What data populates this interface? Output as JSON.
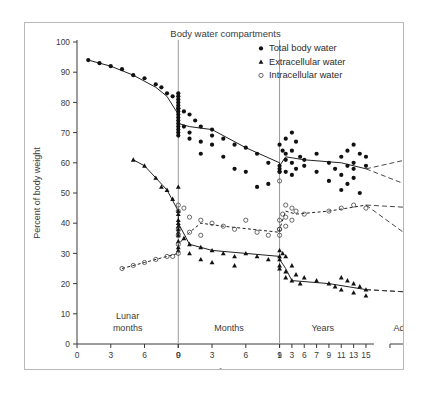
{
  "figure": {
    "title": "Body water compartments",
    "xlabel": "Age",
    "ylabel": "Percent of body weight"
  },
  "legend": {
    "items": [
      {
        "label": "Total body water",
        "marker": "filled-circle"
      },
      {
        "label": "Extracellular water",
        "marker": "filled-triangle"
      },
      {
        "label": "Intracellular water",
        "marker": "open-circle"
      }
    ]
  },
  "axes": {
    "y_ticks": [
      0,
      10,
      20,
      30,
      40,
      50,
      60,
      70,
      80,
      90,
      100
    ],
    "ylim": [
      0,
      100
    ],
    "segments": [
      {
        "name": "Lunar months",
        "ticks": [
          "0",
          "3",
          "6",
          "9"
        ]
      },
      {
        "name": "Months",
        "ticks": [
          "0",
          "3",
          "6",
          "9"
        ]
      },
      {
        "name": "Years",
        "ticks": [
          "1",
          "3",
          "6",
          "7",
          "9",
          "11",
          "13",
          "15"
        ]
      },
      {
        "name": "Adults",
        "ticks": []
      }
    ],
    "sex_symbols": {
      "male": "♂",
      "female": "♀"
    }
  },
  "chart_data": {
    "type": "scatter",
    "title": "Body water compartments",
    "xlabel": "Age",
    "ylabel": "Percent of body weight",
    "ylim": [
      0,
      100
    ],
    "grid": false,
    "legend_position": "top-right",
    "x_axis_note": "Ordinal composite axis: lunar months 0-9 (fetal), postnatal months 0-9, years 1-15, then a separate Adults block",
    "dividers": [
      {
        "label": "birth",
        "at": "lunar 9 / month 0"
      },
      {
        "label": "one year",
        "at": "months 9 / year 1"
      }
    ],
    "series": [
      {
        "name": "Total body water",
        "marker": "filled-circle",
        "line": "solid",
        "trend": [
          {
            "x": "lunar 1",
            "y": 94
          },
          {
            "x": "lunar 3",
            "y": 92
          },
          {
            "x": "lunar 5",
            "y": 89
          },
          {
            "x": "lunar 7",
            "y": 85
          },
          {
            "x": "lunar 8",
            "y": 82
          },
          {
            "x": "lunar 9",
            "y": 76
          },
          {
            "x": "birth",
            "y": 73
          },
          {
            "x": "month 1",
            "y": 72
          },
          {
            "x": "month 3",
            "y": 71
          },
          {
            "x": "month 6",
            "y": 65
          },
          {
            "x": "month 9",
            "y": 60
          },
          {
            "x": "year 1",
            "y": 59
          },
          {
            "x": "year 2",
            "y": 62
          },
          {
            "x": "year 6",
            "y": 61
          },
          {
            "x": "year 11",
            "y": 60
          },
          {
            "x": "year 15",
            "y": 58
          }
        ],
        "adult_branches": [
          {
            "sex": "male",
            "value": 62
          },
          {
            "sex": "female",
            "value": 51
          }
        ],
        "points": [
          {
            "x": "lunar 1",
            "y": 94
          },
          {
            "x": "lunar 2",
            "y": 93
          },
          {
            "x": "lunar 3",
            "y": 92
          },
          {
            "x": "lunar 4",
            "y": 91
          },
          {
            "x": "lunar 5",
            "y": 89
          },
          {
            "x": "lunar 6",
            "y": 88
          },
          {
            "x": "lunar 7",
            "y": 86
          },
          {
            "x": "lunar 7.5",
            "y": 85
          },
          {
            "x": "lunar 8",
            "y": 83
          },
          {
            "x": "lunar 8.5",
            "y": 82
          },
          {
            "x": "lunar 9",
            "y": 81
          },
          {
            "x": "lunar 9",
            "y": 78
          },
          {
            "x": "birth",
            "y": 83
          },
          {
            "x": "birth",
            "y": 82
          },
          {
            "x": "birth",
            "y": 80
          },
          {
            "x": "birth",
            "y": 79
          },
          {
            "x": "birth",
            "y": 78
          },
          {
            "x": "birth",
            "y": 77
          },
          {
            "x": "birth",
            "y": 76
          },
          {
            "x": "birth",
            "y": 75
          },
          {
            "x": "birth",
            "y": 74
          },
          {
            "x": "birth",
            "y": 73
          },
          {
            "x": "birth",
            "y": 72
          },
          {
            "x": "birth",
            "y": 71
          },
          {
            "x": "birth",
            "y": 70
          },
          {
            "x": "birth",
            "y": 69
          },
          {
            "x": "month 0.5",
            "y": 77
          },
          {
            "x": "month 0.5",
            "y": 72
          },
          {
            "x": "month 1",
            "y": 76
          },
          {
            "x": "month 1",
            "y": 70
          },
          {
            "x": "month 1",
            "y": 68
          },
          {
            "x": "month 1.5",
            "y": 74
          },
          {
            "x": "month 2",
            "y": 72
          },
          {
            "x": "month 2",
            "y": 67
          },
          {
            "x": "month 2",
            "y": 63
          },
          {
            "x": "month 3",
            "y": 71
          },
          {
            "x": "month 3",
            "y": 69
          },
          {
            "x": "month 3",
            "y": 66
          },
          {
            "x": "month 4",
            "y": 68
          },
          {
            "x": "month 4",
            "y": 62
          },
          {
            "x": "month 5",
            "y": 66
          },
          {
            "x": "month 5",
            "y": 58
          },
          {
            "x": "month 6",
            "y": 65
          },
          {
            "x": "month 6",
            "y": 57
          },
          {
            "x": "month 7",
            "y": 63
          },
          {
            "x": "month 7",
            "y": 52
          },
          {
            "x": "month 8",
            "y": 60
          },
          {
            "x": "month 8",
            "y": 53
          },
          {
            "x": "month 9",
            "y": 59
          },
          {
            "x": "month 9",
            "y": 57
          },
          {
            "x": "year 1",
            "y": 66
          },
          {
            "x": "year 1",
            "y": 58
          },
          {
            "x": "year 1",
            "y": 57
          },
          {
            "x": "year 1.5",
            "y": 64
          },
          {
            "x": "year 2",
            "y": 68
          },
          {
            "x": "year 2",
            "y": 63
          },
          {
            "x": "year 2",
            "y": 61
          },
          {
            "x": "year 2",
            "y": 57
          },
          {
            "x": "year 3",
            "y": 70
          },
          {
            "x": "year 3",
            "y": 64
          },
          {
            "x": "year 3",
            "y": 60
          },
          {
            "x": "year 3",
            "y": 56
          },
          {
            "x": "year 4",
            "y": 67
          },
          {
            "x": "year 4",
            "y": 58
          },
          {
            "x": "year 5",
            "y": 62
          },
          {
            "x": "year 6",
            "y": 61
          },
          {
            "x": "year 6",
            "y": 59
          },
          {
            "x": "year 7",
            "y": 63
          },
          {
            "x": "year 7",
            "y": 57
          },
          {
            "x": "year 9",
            "y": 60
          },
          {
            "x": "year 9",
            "y": 54
          },
          {
            "x": "year 10",
            "y": 58
          },
          {
            "x": "year 11",
            "y": 62
          },
          {
            "x": "year 11",
            "y": 56
          },
          {
            "x": "year 11",
            "y": 51
          },
          {
            "x": "year 12",
            "y": 64
          },
          {
            "x": "year 12",
            "y": 59
          },
          {
            "x": "year 12",
            "y": 53
          },
          {
            "x": "year 13",
            "y": 66
          },
          {
            "x": "year 13",
            "y": 60
          },
          {
            "x": "year 13",
            "y": 58
          },
          {
            "x": "year 13",
            "y": 55
          },
          {
            "x": "year 14",
            "y": 63
          },
          {
            "x": "year 14",
            "y": 50
          },
          {
            "x": "year 15",
            "y": 62
          },
          {
            "x": "year 15",
            "y": 59
          }
        ]
      },
      {
        "name": "Extracellular water",
        "marker": "filled-triangle",
        "line": "solid",
        "trend": [
          {
            "x": "lunar 5",
            "y": 61
          },
          {
            "x": "lunar 6",
            "y": 59
          },
          {
            "x": "lunar 7",
            "y": 55
          },
          {
            "x": "lunar 8",
            "y": 51
          },
          {
            "x": "lunar 9",
            "y": 44
          },
          {
            "x": "birth",
            "y": 40
          },
          {
            "x": "month 1",
            "y": 33
          },
          {
            "x": "month 3",
            "y": 31
          },
          {
            "x": "month 9",
            "y": 29
          },
          {
            "x": "year 1",
            "y": 28
          },
          {
            "x": "year 2",
            "y": 25
          },
          {
            "x": "year 3",
            "y": 21
          },
          {
            "x": "year 9",
            "y": 20
          },
          {
            "x": "year 15",
            "y": 18
          }
        ],
        "adult_branches": [
          {
            "sex": "male",
            "value": 17
          },
          {
            "sex": "female",
            "value": 17
          }
        ],
        "points": [
          {
            "x": "lunar 5",
            "y": 61
          },
          {
            "x": "lunar 6",
            "y": 59
          },
          {
            "x": "lunar 7",
            "y": 55
          },
          {
            "x": "lunar 7.5",
            "y": 52
          },
          {
            "x": "lunar 8",
            "y": 51
          },
          {
            "x": "lunar 8.5",
            "y": 48
          },
          {
            "x": "lunar 9",
            "y": 52
          },
          {
            "x": "lunar 9",
            "y": 44
          },
          {
            "x": "birth",
            "y": 43
          },
          {
            "x": "birth",
            "y": 41
          },
          {
            "x": "birth",
            "y": 40
          },
          {
            "x": "birth",
            "y": 39
          },
          {
            "x": "birth",
            "y": 38
          },
          {
            "x": "birth",
            "y": 37
          },
          {
            "x": "birth",
            "y": 36
          },
          {
            "x": "birth",
            "y": 34
          },
          {
            "x": "birth",
            "y": 32
          },
          {
            "x": "birth",
            "y": 31
          },
          {
            "x": "month 0.5",
            "y": 35
          },
          {
            "x": "month 1",
            "y": 33
          },
          {
            "x": "month 1",
            "y": 30
          },
          {
            "x": "month 2",
            "y": 32
          },
          {
            "x": "month 2",
            "y": 28
          },
          {
            "x": "month 3",
            "y": 31
          },
          {
            "x": "month 3",
            "y": 27
          },
          {
            "x": "month 4",
            "y": 30
          },
          {
            "x": "month 5",
            "y": 29
          },
          {
            "x": "month 5",
            "y": 26
          },
          {
            "x": "month 6",
            "y": 30
          },
          {
            "x": "month 7",
            "y": 29
          },
          {
            "x": "month 8",
            "y": 28
          },
          {
            "x": "month 9",
            "y": 29
          },
          {
            "x": "month 9",
            "y": 25
          },
          {
            "x": "year 1",
            "y": 31
          },
          {
            "x": "year 1",
            "y": 28
          },
          {
            "x": "year 1",
            "y": 26
          },
          {
            "x": "year 1.5",
            "y": 30
          },
          {
            "x": "year 2",
            "y": 29
          },
          {
            "x": "year 2",
            "y": 24
          },
          {
            "x": "year 2",
            "y": 22
          },
          {
            "x": "year 3",
            "y": 26
          },
          {
            "x": "year 3",
            "y": 21
          },
          {
            "x": "year 4",
            "y": 23
          },
          {
            "x": "year 5",
            "y": 20
          },
          {
            "x": "year 6",
            "y": 22
          },
          {
            "x": "year 7",
            "y": 21
          },
          {
            "x": "year 9",
            "y": 20
          },
          {
            "x": "year 10",
            "y": 19
          },
          {
            "x": "year 11",
            "y": 22
          },
          {
            "x": "year 11",
            "y": 18
          },
          {
            "x": "year 12",
            "y": 21
          },
          {
            "x": "year 13",
            "y": 20
          },
          {
            "x": "year 13",
            "y": 17
          },
          {
            "x": "year 14",
            "y": 19
          },
          {
            "x": "year 15",
            "y": 18
          },
          {
            "x": "year 15",
            "y": 16
          }
        ]
      },
      {
        "name": "Intracellular water",
        "marker": "open-circle",
        "line": "dashed",
        "trend": [
          {
            "x": "lunar 4",
            "y": 25
          },
          {
            "x": "lunar 6",
            "y": 27
          },
          {
            "x": "lunar 8",
            "y": 29
          },
          {
            "x": "lunar 9",
            "y": 30
          },
          {
            "x": "birth",
            "y": 33
          },
          {
            "x": "month 1",
            "y": 37
          },
          {
            "x": "month 2",
            "y": 40
          },
          {
            "x": "month 4",
            "y": 39
          },
          {
            "x": "month 9",
            "y": 37
          },
          {
            "x": "year 1",
            "y": 38
          },
          {
            "x": "year 2",
            "y": 44
          },
          {
            "x": "year 4",
            "y": 43
          },
          {
            "x": "year 9",
            "y": 44
          },
          {
            "x": "year 15",
            "y": 46
          }
        ],
        "adult_branches": [
          {
            "sex": "male",
            "value": 45
          },
          {
            "sex": "female",
            "value": 33
          }
        ],
        "points": [
          {
            "x": "lunar 4",
            "y": 25
          },
          {
            "x": "lunar 5",
            "y": 26
          },
          {
            "x": "lunar 6",
            "y": 27
          },
          {
            "x": "lunar 7",
            "y": 28
          },
          {
            "x": "lunar 8",
            "y": 29
          },
          {
            "x": "lunar 8.5",
            "y": 29
          },
          {
            "x": "lunar 9",
            "y": 30
          },
          {
            "x": "birth",
            "y": 46
          },
          {
            "x": "birth",
            "y": 44
          },
          {
            "x": "birth",
            "y": 38
          },
          {
            "x": "birth",
            "y": 36
          },
          {
            "x": "birth",
            "y": 33
          },
          {
            "x": "month 0.5",
            "y": 45
          },
          {
            "x": "month 1",
            "y": 42
          },
          {
            "x": "month 1",
            "y": 37
          },
          {
            "x": "month 2",
            "y": 41
          },
          {
            "x": "month 2",
            "y": 36
          },
          {
            "x": "month 3",
            "y": 40
          },
          {
            "x": "month 4",
            "y": 39
          },
          {
            "x": "month 5",
            "y": 38
          },
          {
            "x": "month 6",
            "y": 41
          },
          {
            "x": "month 7",
            "y": 37
          },
          {
            "x": "month 8",
            "y": 36
          },
          {
            "x": "month 9",
            "y": 38
          },
          {
            "x": "year 1",
            "y": 54
          },
          {
            "x": "year 1",
            "y": 41
          },
          {
            "x": "year 1",
            "y": 38
          },
          {
            "x": "year 1",
            "y": 36
          },
          {
            "x": "year 1.5",
            "y": 43
          },
          {
            "x": "year 2",
            "y": 46
          },
          {
            "x": "year 2",
            "y": 42
          },
          {
            "x": "year 2",
            "y": 39
          },
          {
            "x": "year 3",
            "y": 45
          },
          {
            "x": "year 3",
            "y": 41
          },
          {
            "x": "year 4",
            "y": 44
          },
          {
            "x": "year 6",
            "y": 43
          },
          {
            "x": "year 9",
            "y": 44
          },
          {
            "x": "year 11",
            "y": 45
          },
          {
            "x": "year 13",
            "y": 46
          },
          {
            "x": "year 15",
            "y": 45
          }
        ]
      }
    ]
  }
}
